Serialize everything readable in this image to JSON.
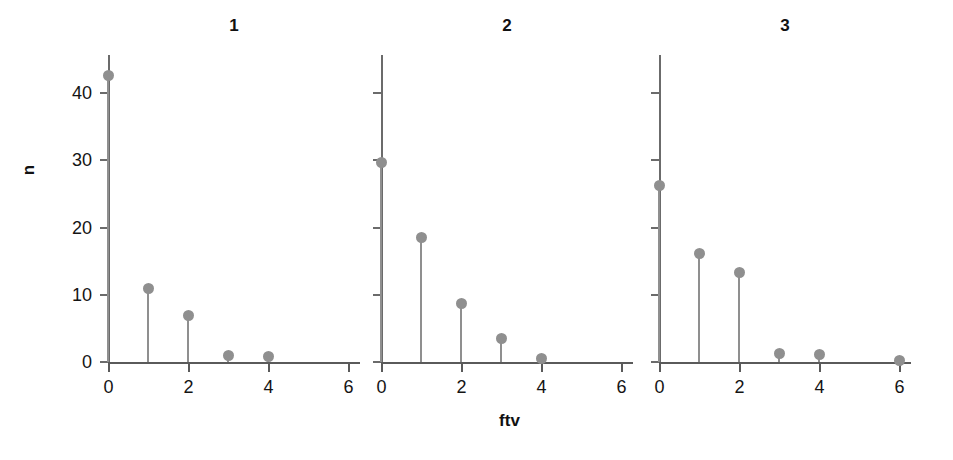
{
  "figure": {
    "axis_label_x": "ftv",
    "axis_label_y": "n",
    "marker_color": "#8f8f8f",
    "axis_color": "#6b6b6b",
    "background_color": "#ffffff"
  },
  "chart_data": {
    "type": "scatter",
    "title": "",
    "xlabel": "ftv",
    "ylabel": "n",
    "xlim": [
      0,
      6
    ],
    "ylim": [
      0,
      45
    ],
    "grid": false,
    "legend": null,
    "xticks": [
      0,
      2,
      4,
      6
    ],
    "xtick_labels": [
      "0",
      "2",
      "4",
      "6"
    ],
    "yticks": [
      0,
      10,
      20,
      30,
      40
    ],
    "ytick_labels": [
      "0",
      "10",
      "20",
      "30",
      "40"
    ],
    "panels": [
      {
        "title": "1",
        "x": [
          0,
          1,
          2,
          3,
          4
        ],
        "y": [
          42.7,
          11.0,
          6.9,
          0.9,
          0.8
        ]
      },
      {
        "title": "2",
        "x": [
          0,
          1,
          2,
          3,
          4
        ],
        "y": [
          29.7,
          18.6,
          8.7,
          3.5,
          0.5
        ]
      },
      {
        "title": "3",
        "x": [
          0,
          1,
          2,
          3,
          4,
          6
        ],
        "y": [
          26.3,
          16.2,
          13.3,
          1.2,
          1.1,
          0.2
        ]
      }
    ]
  },
  "geometry": {
    "baseline_y": 362,
    "y_top_value": 45,
    "px_per_y_unit": 6.72,
    "px_per_x_unit": 40,
    "spine_top_y": 55,
    "panels": [
      {
        "origin_x": 108,
        "axis_right": 360
      },
      {
        "origin_x": 381,
        "axis_right": 633
      },
      {
        "origin_x": 659,
        "axis_right": 911
      }
    ]
  }
}
